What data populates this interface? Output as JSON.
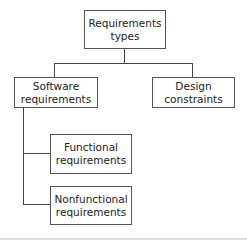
{
  "diagram": {
    "type": "hierarchy",
    "root": {
      "label_line1": "Requirements",
      "label_line2": "types"
    },
    "children": [
      {
        "label_line1": "Software",
        "label_line2": "requirements"
      },
      {
        "label_line1": "Design",
        "label_line2": "constraints"
      }
    ],
    "software_children": [
      {
        "label_line1": "Functional",
        "label_line2": "requirements"
      },
      {
        "label_line1": "Nonfunctional",
        "label_line2": "requirements"
      }
    ],
    "colors": {
      "line": "#444444",
      "border": "#555555",
      "text": "#222222",
      "background": "#ffffff"
    }
  }
}
